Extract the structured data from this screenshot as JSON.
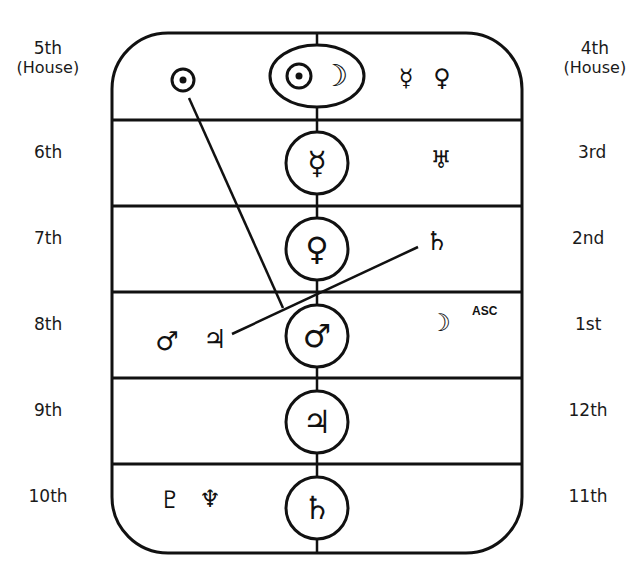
{
  "diagram": {
    "type": "astrological-house-chart",
    "stroke_color": "#111111",
    "background": "#ffffff"
  },
  "left_labels": [
    {
      "house": "5th",
      "sub": "(House)",
      "x": 48,
      "y": 56
    },
    {
      "house": "6th",
      "sub": "",
      "x": 48,
      "y": 152
    },
    {
      "house": "7th",
      "sub": "",
      "x": 48,
      "y": 238
    },
    {
      "house": "8th",
      "sub": "",
      "x": 48,
      "y": 324
    },
    {
      "house": "9th",
      "sub": "",
      "x": 48,
      "y": 410
    },
    {
      "house": "10th",
      "sub": "",
      "x": 48,
      "y": 496
    }
  ],
  "right_labels": [
    {
      "house": "4th",
      "sub": "(House)",
      "x": 595,
      "y": 56
    },
    {
      "house": "3rd",
      "sub": "",
      "x": 592,
      "y": 152
    },
    {
      "house": "2nd",
      "sub": "",
      "x": 588,
      "y": 238
    },
    {
      "house": "1st",
      "sub": "",
      "x": 588,
      "y": 324
    },
    {
      "house": "12th",
      "sub": "",
      "x": 588,
      "y": 410
    },
    {
      "house": "11th",
      "sub": "",
      "x": 588,
      "y": 496
    }
  ],
  "center_column": [
    {
      "row": 1,
      "shape": "ellipse",
      "symbols": [
        "sun",
        "moon"
      ],
      "glyphs": [
        "☉",
        "☽"
      ],
      "cx": 317,
      "cy": 76
    },
    {
      "row": 2,
      "shape": "circle",
      "symbols": [
        "mercury"
      ],
      "glyphs": [
        "☿"
      ],
      "cx": 317,
      "cy": 163
    },
    {
      "row": 3,
      "shape": "circle",
      "symbols": [
        "venus"
      ],
      "glyphs": [
        "♀"
      ],
      "cx": 317,
      "cy": 249
    },
    {
      "row": 4,
      "shape": "circle",
      "symbols": [
        "mars"
      ],
      "glyphs": [
        "♂"
      ],
      "cx": 317,
      "cy": 336
    },
    {
      "row": 5,
      "shape": "circle",
      "symbols": [
        "jupiter"
      ],
      "glyphs": [
        "♃"
      ],
      "cx": 317,
      "cy": 422
    },
    {
      "row": 6,
      "shape": "circle",
      "symbols": [
        "saturn"
      ],
      "glyphs": [
        "♄"
      ],
      "cx": 317,
      "cy": 508
    }
  ],
  "placed_planets": [
    {
      "name": "sun",
      "glyph": "☉",
      "x": 183,
      "y": 80,
      "size": 26
    },
    {
      "name": "mercury",
      "glyph": "☿",
      "x": 406,
      "y": 78,
      "size": 24
    },
    {
      "name": "venus",
      "glyph": "♀",
      "x": 442,
      "y": 78,
      "size": 24
    },
    {
      "name": "uranus",
      "glyph": "♅",
      "x": 441,
      "y": 160,
      "size": 24
    },
    {
      "name": "saturn",
      "glyph": "♄",
      "x": 437,
      "y": 241,
      "size": 26
    },
    {
      "name": "mars",
      "glyph": "♂",
      "x": 167,
      "y": 341,
      "size": 26
    },
    {
      "name": "jupiter",
      "glyph": "♃",
      "x": 215,
      "y": 339,
      "size": 26
    },
    {
      "name": "moon",
      "glyph": "☽",
      "x": 440,
      "y": 323,
      "size": 24
    },
    {
      "name": "pluto",
      "glyph": "♇",
      "x": 170,
      "y": 500,
      "size": 24
    },
    {
      "name": "neptune",
      "glyph": "♆",
      "x": 210,
      "y": 499,
      "size": 24
    }
  ],
  "annotations": [
    {
      "text": "ASC",
      "x": 472,
      "y": 304
    }
  ],
  "aspect_lines": [
    {
      "from": "sun",
      "to": "mars-jupiter",
      "x1": 189,
      "y1": 98,
      "x2": 283,
      "y2": 308
    },
    {
      "from": "jupiter",
      "to": "saturn",
      "x1": 232,
      "y1": 334,
      "x2": 418,
      "y2": 247
    }
  ],
  "frame": {
    "left": 112,
    "right": 522,
    "top": 33,
    "bottom": 553,
    "radius": 56,
    "row_dividers": [
      120,
      206,
      292,
      378,
      464
    ],
    "center_x": 317,
    "circle_radius": 31,
    "ellipse_rx": 47,
    "ellipse_ry": 31
  }
}
